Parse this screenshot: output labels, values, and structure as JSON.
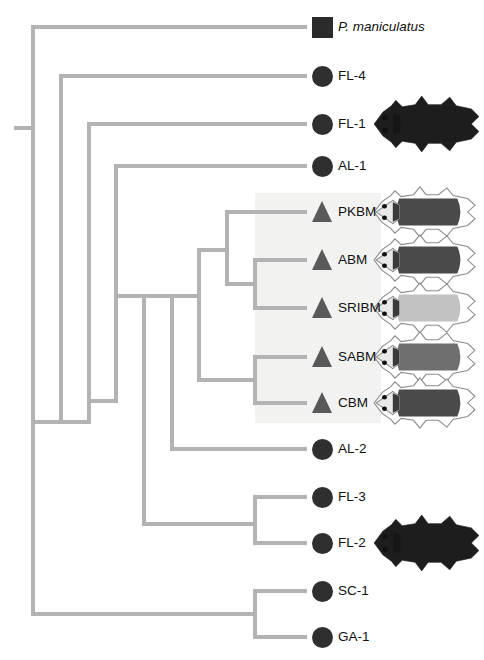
{
  "figure": {
    "type": "phylogenetic-tree",
    "orientation": "left-to-right-rectangular-cladogram",
    "background": "#ffffff",
    "branch_color": "#b3b3b3",
    "branch_width": 4,
    "highlight_box": {
      "label": "beach-mouse-clade-shading",
      "fill": "#f2f2f0",
      "x": 255,
      "y": 193,
      "width": 126,
      "height": 230
    }
  },
  "symbols": {
    "square": {
      "name": "square-marker",
      "color": "#2b2b2b",
      "size": 21
    },
    "circle": {
      "name": "circle-marker",
      "color": "#2f2f2f",
      "size": 21
    },
    "triangle": {
      "name": "triangle-marker",
      "color": "#595959",
      "size": 21
    }
  },
  "tips": [
    {
      "id": "pman",
      "label": "P. maniculatus",
      "symbol": "square",
      "italic": true,
      "y": 27,
      "photo": null
    },
    {
      "id": "fl4",
      "label": "FL-4",
      "symbol": "circle",
      "italic": false,
      "y": 76,
      "photo": null
    },
    {
      "id": "fl1",
      "label": "FL-1",
      "symbol": "circle",
      "italic": false,
      "y": 124,
      "photo": "dark-pelt"
    },
    {
      "id": "al1",
      "label": "AL-1",
      "symbol": "circle",
      "italic": false,
      "y": 166,
      "photo": null
    },
    {
      "id": "pkbm",
      "label": "PKBM",
      "symbol": "triangle",
      "italic": false,
      "y": 212,
      "photo": "dark-pelt-outlined"
    },
    {
      "id": "abm",
      "label": "ABM",
      "symbol": "triangle",
      "italic": false,
      "y": 260,
      "photo": "dark-pelt-outlined"
    },
    {
      "id": "sribm",
      "label": "SRIBM",
      "symbol": "triangle",
      "italic": false,
      "y": 308,
      "photo": "pale-pelt-outlined"
    },
    {
      "id": "sabm",
      "label": "SABM",
      "symbol": "triangle",
      "italic": false,
      "y": 357,
      "photo": "medium-pelt-outlined"
    },
    {
      "id": "cbm",
      "label": "CBM",
      "symbol": "triangle",
      "italic": false,
      "y": 403,
      "photo": "dark-pelt-outlined"
    },
    {
      "id": "al2",
      "label": "AL-2",
      "symbol": "circle",
      "italic": false,
      "y": 449,
      "photo": null
    },
    {
      "id": "fl3",
      "label": "FL-3",
      "symbol": "circle",
      "italic": false,
      "y": 497,
      "photo": null
    },
    {
      "id": "fl2",
      "label": "FL-2",
      "symbol": "circle",
      "italic": false,
      "y": 543,
      "photo": "dark-pelt"
    },
    {
      "id": "sc1",
      "label": "SC-1",
      "symbol": "circle",
      "italic": false,
      "y": 591,
      "photo": null
    },
    {
      "id": "ga1",
      "label": "GA-1",
      "symbol": "circle",
      "italic": false,
      "y": 637,
      "photo": null
    }
  ],
  "layout": {
    "tip_branch_x": 307,
    "symbol_x": 312,
    "label_x": 338,
    "photo_x": 372
  },
  "tree_structure": {
    "newick": "((P. maniculatus,(FL-4,(FL-1,(AL-1,((((PKBM,(ABM,SRIBM)),(SABM,CBM)),AL-2),(FL-3,FL-2)))))),(SC-1,GA-1));",
    "nodes": [
      {
        "name": "root",
        "x": 33,
        "y_top": 27,
        "y_bottom": 637
      },
      {
        "name": "node-fl4",
        "x": 61,
        "y_top": 76,
        "y_bottom": 422
      },
      {
        "name": "node-fl1",
        "x": 89,
        "y_top": 124,
        "y_bottom": 422
      },
      {
        "name": "node-al1",
        "x": 116,
        "y_top": 166,
        "y_bottom": 401
      },
      {
        "name": "node-bm-al2-fl",
        "x": 144,
        "y_top": 296,
        "y_bottom": 524
      },
      {
        "name": "node-bm-al2",
        "x": 172,
        "y_top": 296,
        "y_bottom": 449
      },
      {
        "name": "node-bm-all",
        "x": 199,
        "y_top": 250,
        "y_bottom": 380
      },
      {
        "name": "node-pkbm-abm",
        "x": 227,
        "y_top": 212,
        "y_bottom": 284
      },
      {
        "name": "node-abm-sribm",
        "x": 255,
        "y_top": 260,
        "y_bottom": 308
      },
      {
        "name": "node-sabm-cbm",
        "x": 255,
        "y_top": 357,
        "y_bottom": 403
      },
      {
        "name": "node-fl3-fl2",
        "x": 255,
        "y_top": 497,
        "y_bottom": 543
      },
      {
        "name": "node-sc1-ga1",
        "x": 255,
        "y_top": 591,
        "y_bottom": 637
      }
    ]
  },
  "root_stub": {
    "x1": 14,
    "x2": 33,
    "y": 128
  }
}
